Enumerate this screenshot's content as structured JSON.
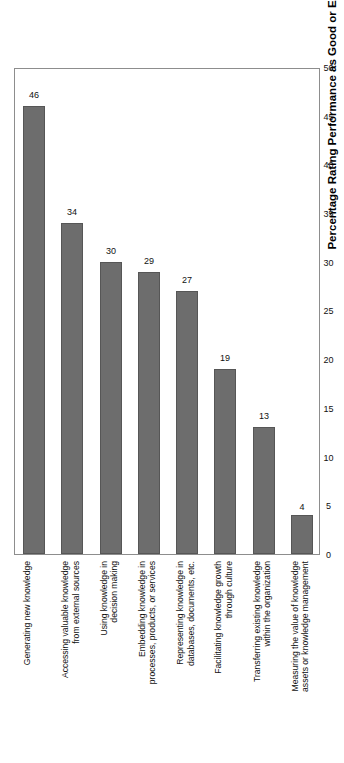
{
  "chart_data": {
    "type": "bar",
    "orientation": "vertical-rotated",
    "title": "",
    "xlabel": "",
    "ylabel": "Percentage Rating Performance as Good or Excellent",
    "axis_title": "Percentage Rating Performance as Good or Excellent",
    "ylim": [
      0,
      50
    ],
    "tick_step": 5,
    "grid": false,
    "legend": false,
    "bar_color": "#6d6d6d",
    "bar_edge_color": "#565656",
    "frame_color": "#8d8d8d",
    "background": "#ffffff",
    "tick_labels": [
      "0",
      "5",
      "10",
      "15",
      "20",
      "25",
      "30",
      "35",
      "40",
      "45",
      "50"
    ],
    "categories": [
      "Generating new knowledge",
      "Accessing valuable knowledge\nfrom external sources",
      "Using knowledge in\ndecision making",
      "Embedding knowledge in\nprocesses, products, or services",
      "Representing knowledge in\ndatabases, documents, etc.",
      "Facilitating knowledge growth\nthrough culture",
      "Transferring existing knowledge\nwithin the organization",
      "Measuring the value of knowledge\nassets or knowledge management"
    ],
    "values": [
      46,
      34,
      30,
      29,
      27,
      19,
      13,
      4
    ],
    "value_labels": [
      "46",
      "34",
      "30",
      "29",
      "27",
      "19",
      "13",
      "4"
    ]
  }
}
